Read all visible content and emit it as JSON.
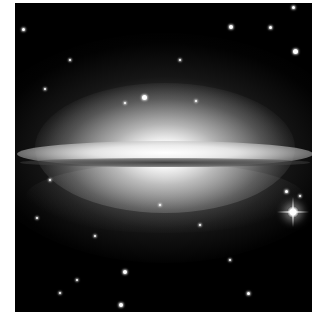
{
  "image": {
    "subject": "Edge-on spiral galaxy with bright central bulge and dark dust lane (Sombrero-like) against a star field",
    "colors": {
      "background": "#000000",
      "border": "#ffffff",
      "core": "#ffffff"
    },
    "stars": [
      {
        "x": 293,
        "y": 7,
        "r": 1.5
      },
      {
        "x": 23,
        "y": 29,
        "r": 1.5
      },
      {
        "x": 231,
        "y": 27,
        "r": 2
      },
      {
        "x": 270,
        "y": 27,
        "r": 1.5
      },
      {
        "x": 295,
        "y": 51,
        "r": 2.5
      },
      {
        "x": 144,
        "y": 97,
        "r": 2.5
      },
      {
        "x": 125,
        "y": 103,
        "r": 1
      },
      {
        "x": 196,
        "y": 101,
        "r": 1
      },
      {
        "x": 45,
        "y": 89,
        "r": 1
      },
      {
        "x": 37,
        "y": 218,
        "r": 1.2
      },
      {
        "x": 95,
        "y": 236,
        "r": 1
      },
      {
        "x": 125,
        "y": 272,
        "r": 2
      },
      {
        "x": 121,
        "y": 305,
        "r": 2
      },
      {
        "x": 248,
        "y": 293,
        "r": 1.5
      },
      {
        "x": 60,
        "y": 293,
        "r": 1
      },
      {
        "x": 77,
        "y": 280,
        "r": 1
      },
      {
        "x": 286,
        "y": 191,
        "r": 1.5
      },
      {
        "x": 300,
        "y": 196,
        "r": 1.2
      },
      {
        "x": 160,
        "y": 205,
        "r": 1
      },
      {
        "x": 200,
        "y": 225,
        "r": 1
      },
      {
        "x": 230,
        "y": 260,
        "r": 1
      },
      {
        "x": 180,
        "y": 60,
        "r": 1
      },
      {
        "x": 70,
        "y": 60,
        "r": 1
      },
      {
        "x": 50,
        "y": 180,
        "r": 1
      }
    ],
    "bright_star": {
      "x": 278,
      "y": 209
    }
  }
}
